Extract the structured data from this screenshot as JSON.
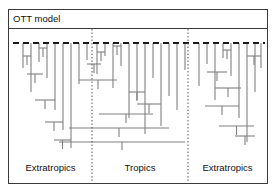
{
  "figure": {
    "title": "OTT model",
    "frame_color": "#3a3a3a",
    "line_color": "#808080",
    "background": "#ffffff",
    "text_color": "#111111"
  },
  "zones": [
    {
      "id": "extratropics-left",
      "label": "Extratropics"
    },
    {
      "id": "tropics",
      "label": "Tropics"
    },
    {
      "id": "extratropics-right",
      "label": "Extratropics"
    }
  ],
  "dividers": {
    "count": 2,
    "positions_px": [
      84,
      180
    ],
    "style": "dotted",
    "color": "#555555"
  },
  "present_line": {
    "style": "dashed",
    "color": "#1a1a1a",
    "y_px": 13,
    "x_start_px": 4,
    "x_end_px": 256,
    "label": ""
  },
  "chart_data": {
    "type": "diagram",
    "subtype": "phylogenetic-tree",
    "title": "OTT model",
    "xlabel": "",
    "ylabel": "",
    "axis_note": "horizontal axis = latitudinal zone, vertical axis = time (present at top, past at bottom)",
    "zone_boundaries_px": [
      84,
      180
    ],
    "tip_count": 30,
    "trees": [
      {
        "zone": "extratropics-left",
        "tips": [
          {
            "x": 14,
            "y_end": 38
          },
          {
            "x": 22,
            "y_end": 62
          },
          {
            "x": 30,
            "y_end": 32
          },
          {
            "x": 38,
            "y_end": 48
          },
          {
            "x": 46,
            "y_end": 80
          },
          {
            "x": 54,
            "y_end": 100
          },
          {
            "x": 62,
            "y_end": 118
          }
        ],
        "nodes": [
          {
            "y": 26,
            "x1": 14,
            "x2": 22
          },
          {
            "y": 18,
            "x1": 30,
            "x2": 38
          },
          {
            "y": 44,
            "x1": 18,
            "x2": 34
          },
          {
            "y": 70,
            "x1": 26,
            "x2": 46
          },
          {
            "y": 92,
            "x1": 36,
            "x2": 54
          },
          {
            "y": 110,
            "x1": 45,
            "x2": 62
          }
        ]
      },
      {
        "zone": "tropics",
        "tips": [
          {
            "x": 70,
            "y_end": 54
          },
          {
            "x": 78,
            "y_end": 30
          },
          {
            "x": 88,
            "y_end": 44
          },
          {
            "x": 96,
            "y_end": 26
          },
          {
            "x": 104,
            "y_end": 58
          },
          {
            "x": 112,
            "y_end": 36
          },
          {
            "x": 120,
            "y_end": 88
          },
          {
            "x": 128,
            "y_end": 70
          },
          {
            "x": 136,
            "y_end": 104
          },
          {
            "x": 144,
            "y_end": 48
          },
          {
            "x": 152,
            "y_end": 96
          },
          {
            "x": 160,
            "y_end": 66
          },
          {
            "x": 168,
            "y_end": 80
          },
          {
            "x": 176,
            "y_end": 40
          }
        ],
        "nodes": [
          {
            "y": 22,
            "x1": 88,
            "x2": 96
          },
          {
            "y": 16,
            "x1": 104,
            "x2": 112
          },
          {
            "y": 34,
            "x1": 78,
            "x2": 92
          },
          {
            "y": 50,
            "x1": 70,
            "x2": 108
          },
          {
            "y": 62,
            "x1": 120,
            "x2": 136
          },
          {
            "y": 74,
            "x1": 128,
            "x2": 152
          },
          {
            "y": 84,
            "x1": 90,
            "x2": 144
          },
          {
            "y": 98,
            "x1": 60,
            "x2": 160
          },
          {
            "y": 112,
            "x1": 50,
            "x2": 176
          }
        ]
      },
      {
        "zone": "extratropics-right",
        "tips": [
          {
            "x": 190,
            "y_end": 56
          },
          {
            "x": 198,
            "y_end": 34
          },
          {
            "x": 206,
            "y_end": 70
          },
          {
            "x": 214,
            "y_end": 28
          },
          {
            "x": 222,
            "y_end": 46
          },
          {
            "x": 230,
            "y_end": 88
          },
          {
            "x": 238,
            "y_end": 112
          },
          {
            "x": 246,
            "y_end": 62
          },
          {
            "x": 252,
            "y_end": 38
          }
        ],
        "nodes": [
          {
            "y": 20,
            "x1": 214,
            "x2": 222
          },
          {
            "y": 26,
            "x1": 238,
            "x2": 252
          },
          {
            "y": 42,
            "x1": 198,
            "x2": 218
          },
          {
            "y": 58,
            "x1": 206,
            "x2": 232
          },
          {
            "y": 76,
            "x1": 196,
            "x2": 230
          },
          {
            "y": 96,
            "x1": 210,
            "x2": 245
          },
          {
            "y": 106,
            "x1": 226,
            "x2": 246
          }
        ]
      }
    ]
  }
}
